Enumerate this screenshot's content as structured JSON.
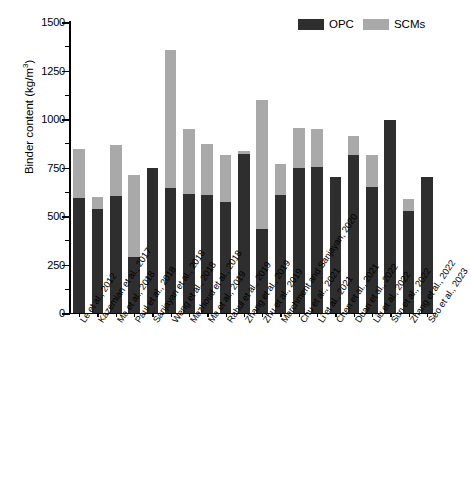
{
  "chart_data": {
    "type": "bar",
    "stacked": true,
    "title": "",
    "xlabel": "",
    "ylabel": "Binder content (kg/m3)",
    "ylabel_display": "Binder content (kg/m",
    "ylabel_sup": "3",
    "ylabel_tail": ")",
    "ylim": [
      0,
      1500
    ],
    "yticks": [
      0,
      250,
      500,
      750,
      1000,
      1250,
      1500
    ],
    "ytick_labels": [
      "0",
      "250",
      "500",
      "750",
      "1000",
      "1250",
      "1500"
    ],
    "grid": false,
    "legend_position": "top-right",
    "categories": [
      "Le et al., 2012",
      "Kazemian et al., 2017",
      "Ma et al., 2018",
      "Paul et al., 2018",
      "Sanjayan et al., 2018",
      "Weng et al., 2018",
      "Mazhoud et al., 2018",
      "Ma et al., 2019",
      "Rahul et al., 2019",
      "Zhang et al., 2019",
      "Zhu et al., 2019",
      "Marchment and Sanjayan, 2020",
      "Chu et al., 2021",
      "Li et al., 2021",
      "Chen et al., 2021",
      "Duan et al., 2022",
      "Liu et al., 2022",
      "Sun et al., 2022",
      "Zhang et al., 2022",
      "Seo et al., 2023"
    ],
    "series": [
      {
        "name": "OPC",
        "color": "#2e2e2e",
        "values": [
          592,
          535,
          605,
          288,
          745,
          643,
          615,
          607,
          570,
          818,
          435,
          608,
          750,
          753,
          703,
          815,
          648,
          995,
          528,
          700
        ]
      },
      {
        "name": "SCMs",
        "color": "#a9a9a9",
        "values": [
          252,
          65,
          262,
          425,
          0,
          715,
          333,
          263,
          245,
          18,
          665,
          160,
          205,
          195,
          0,
          95,
          165,
          0,
          62,
          0
        ]
      }
    ],
    "totals": [
      844,
      600,
      867,
      713,
      745,
      1358,
      948,
      870,
      815,
      836,
      1100,
      768,
      955,
      948,
      703,
      910,
      813,
      995,
      590,
      700
    ]
  },
  "legend": {
    "items": [
      {
        "label": "OPC",
        "color": "#2e2e2e"
      },
      {
        "label": "SCMs",
        "color": "#a9a9a9"
      }
    ]
  }
}
